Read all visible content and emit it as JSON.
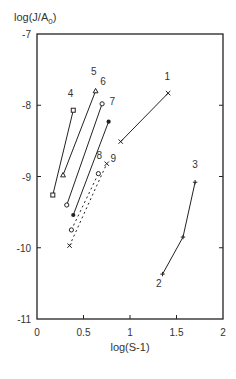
{
  "chart_data": {
    "type": "line",
    "title": "",
    "xlabel": "log(S-1)",
    "ylabel": "log(J/A0)",
    "ylabel_display": {
      "main": "log(J/A",
      "sub": "0",
      "end": ")"
    },
    "xlim": [
      0,
      2
    ],
    "ylim": [
      -11,
      -7
    ],
    "xticks": [
      0,
      0.5,
      1,
      1.5,
      2
    ],
    "xtick_labels": [
      "0",
      "0.5",
      "1",
      "1.5",
      "2"
    ],
    "yticks": [
      -7,
      -8,
      -9,
      -10,
      -11
    ],
    "ytick_labels": [
      "-7",
      "-8",
      "-9",
      "-10",
      "-11"
    ],
    "grid": false,
    "legend": "none (series labeled inline by number)",
    "series": [
      {
        "name": "1",
        "marker": "x",
        "line": "solid",
        "x": [
          0.9,
          1.41
        ],
        "y": [
          -8.51,
          -7.83
        ]
      },
      {
        "name": "2-3",
        "labels": [
          "2",
          "3"
        ],
        "marker": "+",
        "line": "solid",
        "x": [
          1.35,
          1.57,
          1.7
        ],
        "y": [
          -10.37,
          -9.85,
          -9.08
        ]
      },
      {
        "name": "4",
        "marker": "square",
        "line": "solid",
        "x": [
          0.17,
          0.39
        ],
        "y": [
          -9.26,
          -8.07
        ]
      },
      {
        "name": "5",
        "marker": "triangle",
        "line": "solid",
        "x": [
          0.28,
          0.63
        ],
        "y": [
          -8.98,
          -7.8
        ]
      },
      {
        "name": "6",
        "marker": "open-circle",
        "line": "solid",
        "x": [
          0.32,
          0.7
        ],
        "y": [
          -9.4,
          -7.98
        ]
      },
      {
        "name": "7",
        "marker": "filled-circle",
        "line": "solid",
        "x": [
          0.39,
          0.77
        ],
        "y": [
          -9.54,
          -8.23
        ]
      },
      {
        "name": "8",
        "marker": "open-circle",
        "line": "dashed",
        "x": [
          0.37,
          0.66
        ],
        "y": [
          -9.75,
          -8.96
        ]
      },
      {
        "name": "9",
        "marker": "x",
        "line": "dashed",
        "x": [
          0.35,
          0.75
        ],
        "y": [
          -9.97,
          -8.82
        ]
      }
    ],
    "annotations": [
      {
        "text": "1",
        "x": 1.4,
        "y": -7.65
      },
      {
        "text": "2",
        "x": 1.31,
        "y": -10.55
      },
      {
        "text": "3",
        "x": 1.7,
        "y": -8.88
      },
      {
        "text": "4",
        "x": 0.36,
        "y": -7.88
      },
      {
        "text": "5",
        "x": 0.61,
        "y": -7.58
      },
      {
        "text": "6",
        "x": 0.71,
        "y": -7.72
      },
      {
        "text": "7",
        "x": 0.81,
        "y": -8.0
      },
      {
        "text": "8",
        "x": 0.67,
        "y": -8.76
      },
      {
        "text": "9",
        "x": 0.82,
        "y": -8.8
      }
    ]
  }
}
